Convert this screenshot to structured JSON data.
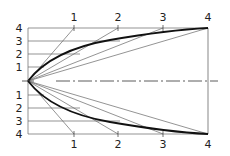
{
  "diagram": {
    "type": "parabolic-construction",
    "colors": {
      "line": "#222222",
      "thin": "#555555",
      "background": "#ffffff"
    },
    "top": {
      "left_labels": [
        "4",
        "3",
        "2",
        "1"
      ],
      "tick_labels": [
        "1",
        "2",
        "3",
        "4"
      ]
    },
    "bottom": {
      "left_labels": [
        "1",
        "2",
        "3",
        "4"
      ],
      "tick_labels": [
        "1",
        "2",
        "3",
        "4"
      ]
    }
  }
}
